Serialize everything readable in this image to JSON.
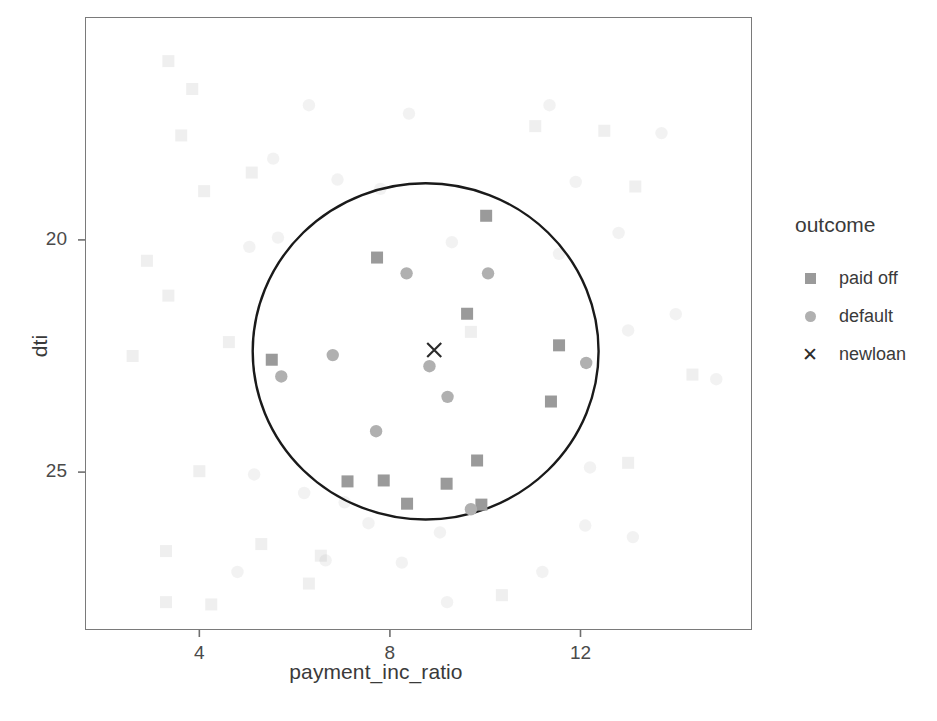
{
  "chart_data": {
    "type": "scatter",
    "title": "",
    "xlabel": "payment_inc_ratio",
    "ylabel": "dti",
    "xticks": [
      4,
      8,
      12
    ],
    "yticks": [
      20,
      25
    ],
    "xlim": [
      1.6,
      15.6
    ],
    "ylim": [
      16.6,
      29.8
    ],
    "grid": false,
    "legend": {
      "position": "right",
      "title": "outcome",
      "entries": [
        {
          "label": "paid off",
          "marker": "square",
          "color": "#9a9a9a"
        },
        {
          "label": "default",
          "marker": "circle",
          "color": "#b0b0b0"
        },
        {
          "label": "newloan",
          "marker": "cross",
          "color": "#2b2b2b"
        }
      ]
    },
    "annotation": {
      "type": "circle",
      "name": "knn-neighborhood-circle",
      "center": [
        8.75,
        22.6
      ],
      "radius_x": 3.63,
      "radius_y": 3.62,
      "stroke": "#1a1a1a",
      "stroke_width": 2.4
    },
    "series": [
      {
        "name": "newloan",
        "marker": "cross",
        "color": "#2b2b2b",
        "highlighted": true,
        "points": [
          [
            8.93,
            22.63
          ]
        ]
      },
      {
        "name": "paid off (in neighborhood)",
        "marker": "square",
        "color": "#9a9a9a",
        "highlighted": true,
        "points": [
          [
            10.02,
            25.52
          ],
          [
            7.73,
            24.62
          ],
          [
            9.62,
            23.41
          ],
          [
            11.55,
            22.73
          ],
          [
            5.52,
            22.42
          ],
          [
            11.38,
            21.52
          ],
          [
            9.83,
            20.25
          ],
          [
            7.87,
            19.82
          ],
          [
            9.19,
            19.75
          ],
          [
            8.36,
            19.32
          ],
          [
            7.11,
            19.8
          ],
          [
            9.92,
            19.3
          ]
        ]
      },
      {
        "name": "default (in neighborhood)",
        "marker": "circle",
        "color": "#b0b0b0",
        "highlighted": true,
        "points": [
          [
            8.35,
            24.28
          ],
          [
            10.06,
            24.28
          ],
          [
            6.8,
            22.52
          ],
          [
            12.12,
            22.35
          ],
          [
            5.72,
            22.06
          ],
          [
            8.83,
            22.28
          ],
          [
            9.21,
            21.62
          ],
          [
            7.71,
            20.88
          ],
          [
            9.7,
            19.2
          ]
        ]
      },
      {
        "name": "paid off (background)",
        "marker": "square",
        "color": "#9a9a9a",
        "highlighted": false,
        "points": [
          [
            3.35,
            28.85
          ],
          [
            3.85,
            28.25
          ],
          [
            3.62,
            27.25
          ],
          [
            11.05,
            27.45
          ],
          [
            12.5,
            27.35
          ],
          [
            5.1,
            26.45
          ],
          [
            4.1,
            26.05
          ],
          [
            13.15,
            26.15
          ],
          [
            2.9,
            24.55
          ],
          [
            3.35,
            23.8
          ],
          [
            9.7,
            23.02
          ],
          [
            2.6,
            22.5
          ],
          [
            4.62,
            22.8
          ],
          [
            14.35,
            22.1
          ],
          [
            4.0,
            20.02
          ],
          [
            13.0,
            20.2
          ],
          [
            3.3,
            18.3
          ],
          [
            5.3,
            18.45
          ],
          [
            6.55,
            18.2
          ],
          [
            6.3,
            17.6
          ],
          [
            3.3,
            17.2
          ],
          [
            4.25,
            17.15
          ],
          [
            10.35,
            17.35
          ]
        ]
      },
      {
        "name": "default (background)",
        "marker": "circle",
        "color": "#b0b0b0",
        "highlighted": false,
        "points": [
          [
            6.3,
            27.9
          ],
          [
            8.4,
            27.72
          ],
          [
            11.35,
            27.9
          ],
          [
            11.9,
            26.25
          ],
          [
            13.7,
            27.3
          ],
          [
            5.55,
            26.75
          ],
          [
            6.9,
            26.3
          ],
          [
            7.8,
            26.1
          ],
          [
            5.65,
            25.05
          ],
          [
            12.8,
            25.15
          ],
          [
            9.3,
            24.95
          ],
          [
            11.55,
            24.7
          ],
          [
            5.05,
            24.85
          ],
          [
            14.0,
            23.4
          ],
          [
            13.0,
            23.05
          ],
          [
            14.85,
            22.0
          ],
          [
            12.2,
            20.1
          ],
          [
            5.15,
            19.95
          ],
          [
            6.2,
            19.55
          ],
          [
            7.05,
            19.35
          ],
          [
            7.55,
            18.9
          ],
          [
            9.05,
            18.7
          ],
          [
            12.1,
            18.85
          ],
          [
            6.65,
            18.1
          ],
          [
            8.25,
            18.05
          ],
          [
            11.2,
            17.85
          ],
          [
            13.1,
            18.6
          ],
          [
            4.8,
            17.85
          ],
          [
            9.2,
            17.2
          ]
        ]
      }
    ]
  },
  "axes": {
    "x_title": "payment_inc_ratio",
    "y_title": "dti",
    "x_tick_labels": [
      "4",
      "8",
      "12"
    ],
    "y_tick_labels": [
      "25",
      "20"
    ]
  },
  "legend": {
    "title": "outcome",
    "items": [
      {
        "label": "paid off",
        "icon": "square-marker-icon"
      },
      {
        "label": "default",
        "icon": "circle-marker-icon"
      },
      {
        "label": "newloan",
        "icon": "cross-marker-icon"
      }
    ]
  },
  "colors": {
    "paid_off": "#9a9a9a",
    "default": "#b0b0b0",
    "newloan": "#2b2b2b",
    "circle_stroke": "#1a1a1a",
    "panel_border": "#7a7a7a",
    "background": "#ffffff"
  }
}
